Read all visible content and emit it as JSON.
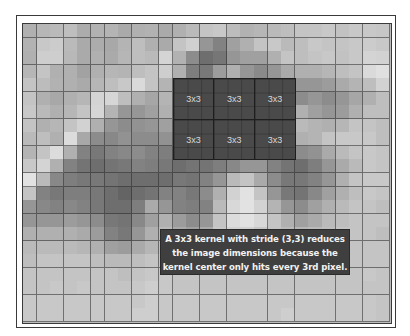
{
  "diagram": {
    "grid": {
      "columns": 27,
      "rows": 22,
      "pixel_gray_levels": [
        [
          176,
          182,
          186,
          190,
          172,
          178,
          180,
          170,
          176,
          178,
          170,
          176,
          186,
          196,
          200,
          188,
          178,
          182,
          186,
          190,
          196,
          196,
          200,
          194,
          200,
          200,
          198
        ],
        [
          178,
          200,
          204,
          186,
          170,
          172,
          168,
          180,
          190,
          176,
          170,
          196,
          208,
          150,
          130,
          160,
          176,
          196,
          200,
          186,
          190,
          200,
          196,
          196,
          200,
          204,
          200
        ],
        [
          176,
          206,
          206,
          184,
          170,
          176,
          170,
          182,
          190,
          186,
          212,
          178,
          140,
          110,
          118,
          150,
          160,
          160,
          176,
          196,
          190,
          196,
          200,
          194,
          200,
          212,
          210
        ],
        [
          182,
          196,
          176,
          176,
          162,
          176,
          182,
          180,
          190,
          196,
          206,
          176,
          126,
          120,
          156,
          176,
          150,
          138,
          150,
          170,
          176,
          176,
          182,
          190,
          196,
          218,
          224
        ],
        [
          196,
          188,
          178,
          176,
          170,
          182,
          190,
          200,
          218,
          196,
          180,
          70,
          70,
          70,
          70,
          70,
          70,
          70,
          70,
          70,
          150,
          150,
          156,
          170,
          180,
          190,
          210
        ],
        [
          196,
          176,
          168,
          176,
          182,
          212,
          214,
          190,
          176,
          166,
          180,
          70,
          70,
          70,
          70,
          70,
          70,
          70,
          70,
          70,
          140,
          150,
          140,
          150,
          166,
          176,
          190
        ],
        [
          200,
          186,
          176,
          182,
          196,
          214,
          180,
          150,
          150,
          160,
          176,
          70,
          70,
          70,
          70,
          70,
          70,
          70,
          70,
          70,
          176,
          160,
          150,
          156,
          176,
          190,
          190
        ],
        [
          196,
          176,
          182,
          196,
          210,
          176,
          150,
          140,
          146,
          150,
          160,
          70,
          70,
          70,
          70,
          70,
          70,
          70,
          70,
          70,
          186,
          180,
          176,
          182,
          196,
          196,
          190
        ],
        [
          186,
          190,
          176,
          220,
          168,
          140,
          136,
          146,
          140,
          140,
          146,
          70,
          70,
          70,
          70,
          70,
          70,
          70,
          70,
          70,
          176,
          180,
          196,
          200,
          200,
          200,
          190
        ],
        [
          180,
          196,
          220,
          176,
          130,
          120,
          130,
          136,
          140,
          130,
          126,
          70,
          70,
          70,
          70,
          70,
          70,
          70,
          70,
          70,
          140,
          146,
          170,
          186,
          196,
          200,
          196
        ],
        [
          200,
          212,
          176,
          130,
          116,
          110,
          116,
          120,
          130,
          126,
          120,
          110,
          116,
          116,
          126,
          136,
          150,
          150,
          130,
          116,
          110,
          126,
          150,
          170,
          186,
          200,
          196
        ],
        [
          226,
          186,
          136,
          126,
          120,
          120,
          116,
          110,
          110,
          110,
          110,
          120,
          116,
          130,
          150,
          186,
          196,
          170,
          140,
          120,
          120,
          130,
          150,
          176,
          196,
          200,
          200
        ],
        [
          196,
          130,
          120,
          126,
          126,
          120,
          110,
          100,
          110,
          116,
          130,
          130,
          120,
          140,
          176,
          210,
          226,
          196,
          150,
          120,
          116,
          136,
          160,
          176,
          190,
          200,
          196
        ],
        [
          150,
          136,
          130,
          136,
          130,
          120,
          110,
          110,
          126,
          170,
          150,
          130,
          126,
          130,
          186,
          216,
          226,
          210,
          180,
          150,
          140,
          160,
          176,
          186,
          196,
          196,
          190
        ],
        [
          150,
          150,
          150,
          156,
          150,
          140,
          120,
          116,
          136,
          160,
          176,
          156,
          140,
          150,
          196,
          220,
          226,
          216,
          196,
          176,
          160,
          170,
          186,
          190,
          196,
          196,
          196
        ],
        [
          176,
          176,
          176,
          176,
          170,
          156,
          130,
          120,
          150,
          176,
          186,
          170,
          160,
          170,
          200,
          210,
          210,
          200,
          196,
          186,
          182,
          186,
          190,
          196,
          196,
          196,
          190
        ],
        [
          186,
          186,
          186,
          186,
          182,
          176,
          160,
          156,
          170,
          182,
          190,
          186,
          190,
          200,
          200,
          200,
          196,
          196,
          190,
          186,
          186,
          190,
          196,
          196,
          196,
          196,
          196
        ],
        [
          190,
          196,
          196,
          196,
          196,
          190,
          186,
          186,
          190,
          196,
          196,
          196,
          196,
          196,
          196,
          196,
          196,
          196,
          196,
          196,
          196,
          196,
          196,
          196,
          196,
          196,
          196
        ],
        [
          196,
          196,
          196,
          196,
          196,
          196,
          196,
          190,
          196,
          200,
          200,
          196,
          196,
          196,
          196,
          196,
          196,
          196,
          196,
          196,
          196,
          196,
          196,
          196,
          196,
          200,
          196
        ],
        [
          196,
          196,
          200,
          196,
          200,
          196,
          196,
          196,
          200,
          206,
          200,
          196,
          196,
          196,
          196,
          196,
          196,
          196,
          196,
          196,
          196,
          196,
          196,
          196,
          196,
          196,
          196
        ],
        [
          200,
          200,
          200,
          200,
          200,
          200,
          200,
          200,
          200,
          206,
          200,
          200,
          200,
          200,
          200,
          200,
          200,
          200,
          200,
          200,
          200,
          200,
          200,
          200,
          200,
          200,
          196
        ],
        [
          200,
          200,
          200,
          200,
          200,
          200,
          200,
          200,
          206,
          206,
          200,
          200,
          200,
          200,
          200,
          200,
          200,
          200,
          200,
          206,
          200,
          200,
          200,
          200,
          200,
          200,
          196
        ]
      ]
    },
    "kernel_region": {
      "start_column": 11,
      "start_row": 4,
      "kernel_size": 3,
      "stride": [
        3,
        3
      ],
      "blocks_across": 3,
      "blocks_down": 2,
      "block_label": "3x3",
      "blocks": [
        {
          "label": "3x3"
        },
        {
          "label": "3x3"
        },
        {
          "label": "3x3"
        },
        {
          "label": "3x3"
        },
        {
          "label": "3x3"
        },
        {
          "label": "3x3"
        }
      ]
    },
    "annotation": {
      "lines": [
        "A 3x3 kernel with stride (3,3) reduces",
        "the image dimensions because the",
        "kernel center only hits every 3rd pixel."
      ]
    },
    "colors": {
      "kernel_fill": "#4a4a4a",
      "annotation_fill": "#3f3f3f",
      "annotation_text": "#f2f2f2",
      "kernel_text": "#d8d8d8"
    }
  }
}
